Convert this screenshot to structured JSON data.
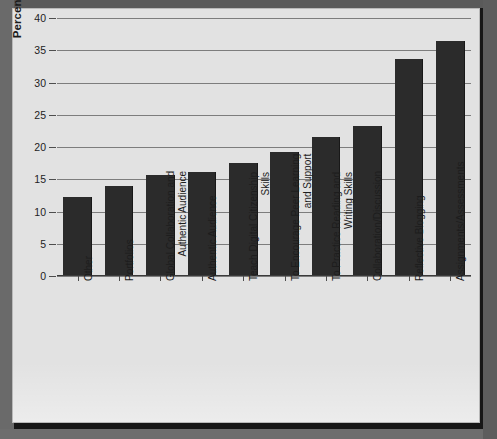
{
  "chart_data": {
    "type": "bar",
    "title": "",
    "xlabel": "",
    "ylabel": "Percentage of Respondents",
    "ylim": [
      0,
      40
    ],
    "yticks": [
      0,
      5,
      10,
      15,
      20,
      25,
      30,
      35,
      40
    ],
    "grid": true,
    "legend": false,
    "orientation": "vertical",
    "bar_color": "#2b2b2b",
    "panel_color": "#e2e2e2",
    "categories": [
      "Other",
      "Portfolios",
      "Global Collaboration and\nAuthentic Audience",
      "Authentic Audience",
      "Teach Digital Citizenship\nSkills",
      "To Encourage Peer Learning\nand Support",
      "To Practice Reading and\nWriting Skills",
      "Collaboration/Discussion",
      "Reflective Blogging",
      "Assignments/Assessments"
    ],
    "values": [
      12.3,
      14.0,
      15.6,
      16.2,
      17.5,
      19.2,
      21.6,
      23.3,
      33.6,
      36.5
    ]
  }
}
